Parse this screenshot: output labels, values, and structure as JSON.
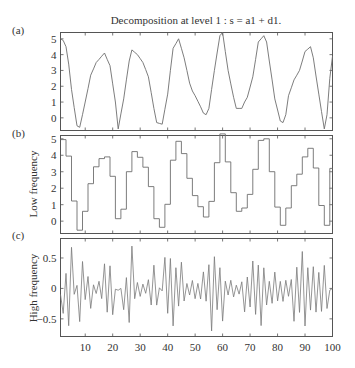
{
  "title": "Decomposition at level 1 : s = a1 + d1.",
  "panels": [
    {
      "id": "a",
      "label": "(a)",
      "ylabel": "",
      "yticks": [
        0,
        1,
        2,
        3,
        4,
        5
      ],
      "ylim": [
        -0.8,
        5.4
      ]
    },
    {
      "id": "b",
      "label": "(b)",
      "ylabel": "Low frequency",
      "yticks": [
        0,
        1,
        2,
        3,
        4,
        5
      ],
      "ylim": [
        -0.75,
        5.2
      ]
    },
    {
      "id": "c",
      "label": "(c)",
      "ylabel": "High frequency",
      "yticks": [
        -0.5,
        0,
        0.5
      ],
      "ylim": [
        -0.79,
        0.82
      ]
    }
  ],
  "xaxis": {
    "ticks": [
      10,
      20,
      30,
      40,
      50,
      60,
      70,
      80,
      90,
      100
    ],
    "xlim": [
      1,
      100
    ]
  },
  "colors": {
    "line": "#6e6e6e",
    "axis": "#555555",
    "text": "#333333"
  },
  "chart_data": {
    "type": "line",
    "title": "Decomposition at level 1 : s = a1 + d1.",
    "xlabel": "",
    "x_range": [
      1,
      100
    ],
    "layout": "3 vertically stacked subplots sharing x axis, no grid, no legend",
    "series": [
      {
        "name": "(a) Signal s",
        "ylabel": "",
        "ylim": [
          -0.8,
          5.4
        ],
        "keypoints_x": [
          1,
          2,
          3,
          4,
          5,
          7,
          8,
          10,
          12,
          14,
          16,
          17,
          19,
          21,
          22,
          24,
          26,
          27,
          29,
          31,
          33,
          35,
          36,
          38,
          40,
          41,
          42,
          44,
          46,
          48,
          49,
          50,
          52,
          53,
          54,
          55,
          57,
          59,
          60,
          62,
          64,
          65,
          67,
          68,
          69,
          71,
          73,
          75,
          76,
          77,
          79,
          81,
          82,
          83,
          84,
          86,
          88,
          90,
          92,
          93,
          95,
          97,
          98,
          99,
          100
        ],
        "keypoints_y": [
          5.0,
          4.9,
          4.5,
          3.4,
          1.8,
          -0.5,
          -0.6,
          1.0,
          2.7,
          3.5,
          3.9,
          4.1,
          3.3,
          1.0,
          -0.7,
          1.2,
          3.6,
          4.3,
          4.0,
          3.5,
          2.6,
          0.6,
          -0.3,
          -0.4,
          1.5,
          3.0,
          4.4,
          5.0,
          3.8,
          2.2,
          1.7,
          1.4,
          0.7,
          0.3,
          0.2,
          0.6,
          3.0,
          5.2,
          5.4,
          3.0,
          1.3,
          0.6,
          0.6,
          1.0,
          1.3,
          2.6,
          4.8,
          5.2,
          4.8,
          3.6,
          1.2,
          -0.2,
          -0.3,
          0.2,
          1.4,
          2.4,
          3.0,
          4.2,
          4.5,
          3.8,
          1.5,
          -0.7,
          0.2,
          2.5,
          3.9
        ],
        "yticks": [
          0,
          1,
          2,
          3,
          4,
          5
        ]
      },
      {
        "name": "(b) Low frequency (approximation a1, piecewise-constant pairs)",
        "ylabel": "Low frequency",
        "ylim": [
          -0.75,
          5.2
        ],
        "derived": "mean of consecutive sample pairs of (a)",
        "yticks": [
          0,
          1,
          2,
          3,
          4,
          5
        ]
      },
      {
        "name": "(c) High frequency (detail d1)",
        "ylabel": "High frequency",
        "ylim": [
          -0.79,
          0.82
        ],
        "derived": "alternating ±0.0–0.75 oscillation, (a) minus (b) amplified detail",
        "amplitudes": [
          0.55,
          0.72,
          0.1,
          0.55,
          0.33,
          0.1,
          0.15,
          0.7,
          0.43,
          0.0,
          0.42,
          0.72,
          0.2,
          0.12,
          0.28,
          0.48,
          0.02,
          0.78,
          0.6,
          0.45,
          0.22,
          0.15,
          0.18,
          0.32,
          0.75,
          0.6,
          0.52,
          0.2,
          0.1,
          0.12,
          0.4,
          0.48,
          0.78,
          0.38,
          0.28,
          0.3,
          0.2,
          0.24,
          0.5,
          0.72,
          0.62,
          0.4,
          0.52,
          0.42,
          0.0
        ],
        "yticks": [
          -0.5,
          0,
          0.5
        ]
      }
    ]
  }
}
